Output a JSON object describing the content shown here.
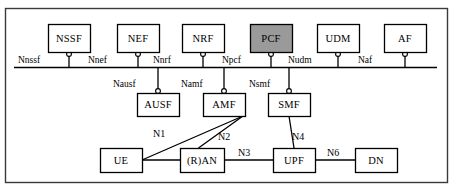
{
  "diagram": {
    "frame": {
      "x": 5,
      "y": 8,
      "width": 442,
      "height": 174,
      "border_color": "#3a3a3a"
    },
    "bus": {
      "label": "service-based-interface-bus",
      "x1": 14,
      "x2": 437,
      "y": 67,
      "color": "#000000"
    },
    "colors": {
      "box_stroke": "#000000",
      "box_fill": "#ffffff",
      "highlight_fill": "#9a9a9a",
      "line": "#000000",
      "frame": "#3a3a3a"
    },
    "nf_boxes": [
      {
        "id": "nssf",
        "label": "NSSF",
        "x": 48,
        "y": 24,
        "w": 42,
        "h": 28,
        "highlight": false,
        "service": "Nnssf",
        "row": "top"
      },
      {
        "id": "nef",
        "label": "NEF",
        "x": 117,
        "y": 24,
        "w": 42,
        "h": 28,
        "highlight": false,
        "service": "Nnef",
        "row": "top"
      },
      {
        "id": "nrf",
        "label": "NRF",
        "x": 182,
        "y": 24,
        "w": 42,
        "h": 28,
        "highlight": false,
        "service": "Nnrf",
        "row": "top"
      },
      {
        "id": "pcf",
        "label": "PCF",
        "x": 250,
        "y": 24,
        "w": 42,
        "h": 28,
        "highlight": true,
        "service": "Npcf",
        "row": "top"
      },
      {
        "id": "udm",
        "label": "UDM",
        "x": 317,
        "y": 24,
        "w": 42,
        "h": 28,
        "highlight": false,
        "service": "Nudm",
        "row": "top"
      },
      {
        "id": "af",
        "label": "AF",
        "x": 384,
        "y": 24,
        "w": 42,
        "h": 28,
        "highlight": false,
        "service": "Naf",
        "row": "top"
      },
      {
        "id": "ausf",
        "label": "AUSF",
        "x": 137,
        "y": 93,
        "w": 42,
        "h": 23,
        "highlight": false,
        "service": "Nausf",
        "row": "middle"
      },
      {
        "id": "amf",
        "label": "AMF",
        "x": 203,
        "y": 93,
        "w": 42,
        "h": 23,
        "highlight": false,
        "service": "Namf",
        "row": "middle"
      },
      {
        "id": "smf",
        "label": "SMF",
        "x": 268,
        "y": 93,
        "w": 42,
        "h": 23,
        "highlight": false,
        "service": "Nsmf",
        "row": "middle"
      },
      {
        "id": "ue",
        "label": "UE",
        "x": 100,
        "y": 148,
        "w": 42,
        "h": 24,
        "highlight": false,
        "service": "",
        "row": "bottom"
      },
      {
        "id": "ran",
        "label": "(R)AN",
        "x": 180,
        "y": 148,
        "w": 44,
        "h": 24,
        "highlight": false,
        "service": "",
        "row": "bottom"
      },
      {
        "id": "upf",
        "label": "UPF",
        "x": 273,
        "y": 148,
        "w": 42,
        "h": 24,
        "highlight": false,
        "service": "",
        "row": "bottom"
      },
      {
        "id": "dn",
        "label": "DN",
        "x": 355,
        "y": 148,
        "w": 42,
        "h": 24,
        "highlight": false,
        "service": "",
        "row": "bottom"
      }
    ],
    "service_labels": [
      {
        "id": "nnssf",
        "text": "Nnssf",
        "x": 18,
        "y": 55
      },
      {
        "id": "nnef",
        "text": "Nnef",
        "x": 88,
        "y": 55
      },
      {
        "id": "nnrf",
        "text": "Nnrf",
        "x": 153,
        "y": 55
      },
      {
        "id": "npcf",
        "text": "Npcf",
        "x": 222,
        "y": 55
      },
      {
        "id": "nudm",
        "text": "Nudm",
        "x": 288,
        "y": 55
      },
      {
        "id": "naf",
        "text": "Naf",
        "x": 358,
        "y": 55
      },
      {
        "id": "nausf",
        "text": "Nausf",
        "x": 113,
        "y": 79
      },
      {
        "id": "namf",
        "text": "Namf",
        "x": 181,
        "y": 79
      },
      {
        "id": "nsmf",
        "text": "Nsmf",
        "x": 249,
        "y": 79
      }
    ],
    "reference_points": [
      {
        "id": "n1",
        "label": "N1",
        "from": "ue",
        "to": "amf",
        "label_x": 153,
        "label_y": 128
      },
      {
        "id": "n2",
        "label": "N2",
        "from": "ran",
        "to": "amf",
        "label_x": 218,
        "label_y": 131
      },
      {
        "id": "n3",
        "label": "N3",
        "from": "ran",
        "to": "upf",
        "label_x": 238,
        "label_y": 147
      },
      {
        "id": "n4",
        "label": "N4",
        "from": "smf",
        "to": "upf",
        "label_x": 292,
        "label_y": 131
      },
      {
        "id": "n6",
        "label": "N6",
        "from": "upf",
        "to": "dn",
        "label_x": 327,
        "label_y": 147
      }
    ]
  }
}
